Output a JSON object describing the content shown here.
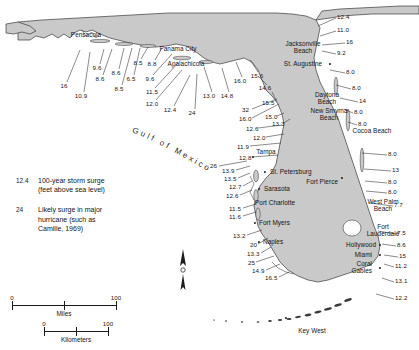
{
  "map": {
    "water_label": "Gulf of Mexico",
    "land_color": "#c9c9c9",
    "water_color": "#ffffff",
    "outline_color": "#3a3a3a"
  },
  "legend": {
    "entries": [
      {
        "key": "12.4",
        "description": "100-year storm surge\n(feet above sea level)"
      },
      {
        "key": "24",
        "description": "Likely surge in major\nhurricane (such as\nCamille, 1969)"
      }
    ]
  },
  "scale": {
    "miles": {
      "label": "Miles",
      "min": "0",
      "max": "100"
    },
    "kilometers": {
      "label": "Kilometers",
      "min": "0",
      "max": "100"
    }
  },
  "compass": {
    "label": "N"
  },
  "cities": [
    {
      "name": "Pensacola",
      "x": 86,
      "y": 35,
      "align": "c",
      "dot": false
    },
    {
      "name": "Panama City",
      "x": 178,
      "y": 49,
      "align": "c",
      "dot": false
    },
    {
      "name": "Apalachicola",
      "x": 186,
      "y": 64,
      "align": "c",
      "dot": false
    },
    {
      "name": "Jacksonville\nBeach",
      "x": 303,
      "y": 47,
      "align": "c",
      "dot": false
    },
    {
      "name": "St. Augustine",
      "x": 303,
      "y": 64,
      "align": "c",
      "dot": true,
      "dot_x": 330,
      "dot_y": 64
    },
    {
      "name": "Daytona\nBeach",
      "x": 327,
      "y": 98,
      "align": "c",
      "dot": false
    },
    {
      "name": "New Smyrna\nBeach",
      "x": 329,
      "y": 114,
      "align": "c",
      "dot": false
    },
    {
      "name": "Cocoa Beach",
      "x": 372,
      "y": 131,
      "align": "c",
      "dot": false
    },
    {
      "name": "Tampa",
      "x": 266,
      "y": 152,
      "align": "c",
      "dot": true,
      "dot_x": 253,
      "dot_y": 157
    },
    {
      "name": "St. Petersburg",
      "x": 270,
      "y": 172,
      "align": "l",
      "dot": true,
      "dot_x": 265,
      "dot_y": 172
    },
    {
      "name": "Sarasota",
      "x": 264,
      "y": 189,
      "align": "l",
      "dot": true,
      "dot_x": 259,
      "dot_y": 189
    },
    {
      "name": "Fort Pierce",
      "x": 338,
      "y": 182,
      "align": "r",
      "dot": true,
      "dot_x": 342,
      "dot_y": 178
    },
    {
      "name": "Port Charlotte",
      "x": 255,
      "y": 203,
      "align": "l",
      "dot": false
    },
    {
      "name": "West Palm\nBeach",
      "x": 383,
      "y": 205,
      "align": "c",
      "dot": false
    },
    {
      "name": "Fort Myers",
      "x": 259,
      "y": 223,
      "align": "l",
      "dot": true,
      "dot_x": 255,
      "dot_y": 223
    },
    {
      "name": "Fort\nLauderdale",
      "x": 383,
      "y": 230,
      "align": "c",
      "dot": false
    },
    {
      "name": "Naples",
      "x": 263,
      "y": 242,
      "align": "l",
      "dot": true,
      "dot_x": 259,
      "dot_y": 242
    },
    {
      "name": "Hollywood",
      "x": 376,
      "y": 245,
      "align": "r",
      "dot": true,
      "dot_x": 380,
      "dot_y": 245
    },
    {
      "name": "Miami",
      "x": 372,
      "y": 255,
      "align": "r",
      "dot": true,
      "dot_x": 380,
      "dot_y": 255
    },
    {
      "name": "Coral\nGables",
      "x": 372,
      "y": 267,
      "align": "r",
      "dot": true,
      "dot_x": 380,
      "dot_y": 268
    },
    {
      "name": "Key West",
      "x": 312,
      "y": 331,
      "align": "c",
      "dot": true,
      "dot_x": 286,
      "dot_y": 318
    }
  ],
  "surge_points": [
    {
      "value": "16",
      "x": 64,
      "y": 86,
      "align": "c",
      "leader": [
        [
          67,
          82
        ],
        [
          80,
          50
        ]
      ]
    },
    {
      "value": "10.9",
      "x": 81,
      "y": 96,
      "align": "c",
      "leader": [
        [
          84,
          92
        ],
        [
          90,
          52
        ]
      ]
    },
    {
      "value": "9.6",
      "x": 97,
      "y": 68,
      "align": "c",
      "leader": [
        [
          100,
          64
        ],
        [
          104,
          49
        ]
      ]
    },
    {
      "value": "8.6",
      "x": 100,
      "y": 79,
      "align": "c",
      "leader": [
        [
          103,
          75
        ],
        [
          112,
          49
        ]
      ]
    },
    {
      "value": "8.6",
      "x": 116,
      "y": 73,
      "align": "c",
      "leader": [
        [
          119,
          69
        ],
        [
          124,
          48
        ]
      ]
    },
    {
      "value": "8.5",
      "x": 119,
      "y": 89,
      "align": "c",
      "leader": [
        [
          122,
          85
        ],
        [
          132,
          48
        ]
      ]
    },
    {
      "value": "6.5",
      "x": 131,
      "y": 79,
      "align": "c",
      "leader": [
        [
          134,
          75
        ],
        [
          140,
          48
        ]
      ]
    },
    {
      "value": "8.5",
      "x": 138,
      "y": 63,
      "align": "c",
      "leader": [
        [
          141,
          59
        ],
        [
          148,
          47
        ]
      ]
    },
    {
      "value": "8.8",
      "x": 152,
      "y": 64,
      "align": "c",
      "leader": [
        [
          155,
          60
        ],
        [
          162,
          48
        ]
      ]
    },
    {
      "value": "9.6",
      "x": 150,
      "y": 79,
      "align": "c",
      "leader": [
        [
          153,
          75
        ],
        [
          172,
          54
        ]
      ]
    },
    {
      "value": "11.5",
      "x": 152,
      "y": 92,
      "align": "c",
      "leader": [
        [
          155,
          88
        ],
        [
          178,
          63
        ]
      ]
    },
    {
      "value": "12.0",
      "x": 152,
      "y": 104,
      "align": "c",
      "leader": [
        [
          156,
          100
        ],
        [
          182,
          70
        ]
      ]
    },
    {
      "value": "12.4",
      "x": 170,
      "y": 110,
      "align": "c",
      "leader": [
        [
          174,
          106
        ],
        [
          190,
          75
        ]
      ]
    },
    {
      "value": "24",
      "x": 192,
      "y": 113,
      "align": "c",
      "leader": [
        [
          195,
          109
        ],
        [
          197,
          74
        ]
      ]
    },
    {
      "value": "13.0",
      "x": 209,
      "y": 96,
      "align": "c",
      "leader": [
        [
          212,
          92
        ],
        [
          204,
          67
        ]
      ]
    },
    {
      "value": "14.8",
      "x": 227,
      "y": 96,
      "align": "c",
      "leader": [
        [
          229,
          92
        ],
        [
          222,
          68
        ]
      ]
    },
    {
      "value": "16.0",
      "x": 240,
      "y": 81,
      "align": "c",
      "leader": [
        [
          242,
          77
        ],
        [
          236,
          62
        ]
      ]
    },
    {
      "value": "15.6",
      "x": 257,
      "y": 76,
      "align": "c",
      "leader": [
        [
          258,
          72
        ],
        [
          250,
          60
        ]
      ]
    },
    {
      "value": "14.6",
      "x": 265,
      "y": 88,
      "align": "c",
      "leader": [
        [
          267,
          85
        ],
        [
          258,
          76
        ]
      ]
    },
    {
      "value": "15.5",
      "x": 262,
      "y": 103,
      "align": "l",
      "leader": [
        [
          277,
          102
        ],
        [
          272,
          92
        ]
      ]
    },
    {
      "value": "32",
      "x": 242,
      "y": 110,
      "align": "l",
      "leader": [
        [
          252,
          109
        ],
        [
          277,
          99
        ]
      ]
    },
    {
      "value": "16.0",
      "x": 239,
      "y": 119,
      "align": "l",
      "leader": [
        [
          252,
          118
        ],
        [
          279,
          104
        ]
      ]
    },
    {
      "value": "15.0",
      "x": 265,
      "y": 117,
      "align": "l",
      "leader": [
        [
          277,
          116
        ],
        [
          284,
          113
        ]
      ]
    },
    {
      "value": "13.3",
      "x": 272,
      "y": 124,
      "align": "l",
      "leader": [
        [
          284,
          123
        ],
        [
          290,
          119
        ]
      ]
    },
    {
      "value": "12.6",
      "x": 246,
      "y": 129,
      "align": "l",
      "leader": [
        [
          258,
          128
        ],
        [
          282,
          125
        ]
      ]
    },
    {
      "value": "12.0",
      "x": 253,
      "y": 138,
      "align": "l",
      "leader": [
        [
          266,
          137
        ],
        [
          284,
          134
        ]
      ]
    },
    {
      "value": "11.9",
      "x": 237,
      "y": 147,
      "align": "l",
      "leader": [
        [
          250,
          146
        ],
        [
          281,
          143
        ]
      ]
    },
    {
      "value": "12.8",
      "x": 239,
      "y": 158,
      "align": "l",
      "leader": [
        [
          252,
          157
        ],
        [
          278,
          155
        ]
      ]
    },
    {
      "value": "26",
      "x": 210,
      "y": 166,
      "align": "l",
      "leader": [
        [
          219,
          166
        ],
        [
          247,
          161
        ]
      ]
    },
    {
      "value": "13.9",
      "x": 222,
      "y": 171,
      "align": "l",
      "leader": [
        [
          236,
          170
        ],
        [
          250,
          166
        ]
      ]
    },
    {
      "value": "13.5",
      "x": 224,
      "y": 179,
      "align": "l",
      "leader": [
        [
          238,
          178
        ],
        [
          250,
          173
        ]
      ]
    },
    {
      "value": "12.7",
      "x": 229,
      "y": 187,
      "align": "l",
      "leader": [
        [
          243,
          186
        ],
        [
          252,
          181
        ]
      ]
    },
    {
      "value": "12.6",
      "x": 226,
      "y": 196,
      "align": "l",
      "leader": [
        [
          240,
          195
        ],
        [
          252,
          190
        ]
      ]
    },
    {
      "value": "11.5",
      "x": 229,
      "y": 209,
      "align": "l",
      "leader": [
        [
          243,
          208
        ],
        [
          256,
          204
        ]
      ]
    },
    {
      "value": "11.6",
      "x": 229,
      "y": 217,
      "align": "l",
      "leader": [
        [
          243,
          216
        ],
        [
          256,
          212
        ]
      ]
    },
    {
      "value": "13.2",
      "x": 233,
      "y": 236,
      "align": "l",
      "leader": [
        [
          247,
          235
        ],
        [
          262,
          230
        ]
      ]
    },
    {
      "value": "20",
      "x": 250,
      "y": 245,
      "align": "l",
      "leader": [
        [
          258,
          244
        ],
        [
          268,
          238
        ]
      ]
    },
    {
      "value": "13.3",
      "x": 247,
      "y": 254,
      "align": "l",
      "leader": [
        [
          261,
          253
        ],
        [
          271,
          247
        ]
      ]
    },
    {
      "value": "25",
      "x": 248,
      "y": 263,
      "align": "l",
      "leader": [
        [
          256,
          262
        ],
        [
          274,
          256
        ]
      ]
    },
    {
      "value": "14.9",
      "x": 252,
      "y": 271,
      "align": "l",
      "leader": [
        [
          266,
          270
        ],
        [
          280,
          264
        ]
      ]
    },
    {
      "value": "16.5",
      "x": 265,
      "y": 278,
      "align": "l",
      "leader": [
        [
          279,
          277
        ],
        [
          289,
          272
        ]
      ]
    },
    {
      "value": "12.4",
      "x": 337,
      "y": 17,
      "align": "l",
      "leader": [
        [
          336,
          18
        ],
        [
          318,
          26
        ]
      ]
    },
    {
      "value": "11.0",
      "x": 337,
      "y": 30,
      "align": "l",
      "leader": [
        [
          336,
          31
        ],
        [
          320,
          36
        ]
      ]
    },
    {
      "value": "16",
      "x": 346,
      "y": 42,
      "align": "l",
      "leader": [
        [
          345,
          43
        ],
        [
          322,
          45
        ]
      ]
    },
    {
      "value": "9.2",
      "x": 337,
      "y": 53,
      "align": "l",
      "leader": [
        [
          336,
          54
        ],
        [
          322,
          51
        ]
      ]
    },
    {
      "value": "8.0",
      "x": 346,
      "y": 72,
      "align": "l",
      "leader": [
        [
          345,
          73
        ],
        [
          330,
          70
        ]
      ]
    },
    {
      "value": "8.0",
      "x": 352,
      "y": 88,
      "align": "l",
      "leader": [
        [
          351,
          89
        ],
        [
          336,
          85
        ]
      ]
    },
    {
      "value": "14",
      "x": 359,
      "y": 101,
      "align": "l",
      "leader": [
        [
          358,
          102
        ],
        [
          340,
          98
        ]
      ]
    },
    {
      "value": "8.0",
      "x": 354,
      "y": 112,
      "align": "l",
      "leader": [
        [
          353,
          113
        ],
        [
          344,
          109
        ]
      ]
    },
    {
      "value": "8.0",
      "x": 358,
      "y": 124,
      "align": "l",
      "leader": [
        [
          357,
          125
        ],
        [
          348,
          122
        ]
      ]
    },
    {
      "value": "8.0",
      "x": 388,
      "y": 154,
      "align": "l",
      "leader": [
        [
          387,
          155
        ],
        [
          362,
          153
        ]
      ]
    },
    {
      "value": "13",
      "x": 392,
      "y": 170,
      "align": "l",
      "leader": [
        [
          391,
          171
        ],
        [
          364,
          169
        ]
      ]
    },
    {
      "value": "8.0",
      "x": 388,
      "y": 182,
      "align": "l",
      "leader": [
        [
          387,
          183
        ],
        [
          365,
          181
        ]
      ]
    },
    {
      "value": "8.0",
      "x": 388,
      "y": 192,
      "align": "l",
      "leader": [
        [
          387,
          193
        ],
        [
          366,
          191
        ]
      ]
    },
    {
      "value": "7.7",
      "x": 394,
      "y": 205,
      "align": "l",
      "leader": [
        [
          393,
          206
        ],
        [
          370,
          203
        ]
      ]
    },
    {
      "value": "7.5",
      "x": 397,
      "y": 233,
      "align": "l",
      "leader": [
        [
          396,
          234
        ],
        [
          378,
          231
        ]
      ]
    },
    {
      "value": "8.6",
      "x": 397,
      "y": 245,
      "align": "l",
      "leader": [
        [
          396,
          246
        ],
        [
          382,
          244
        ]
      ]
    },
    {
      "value": "15",
      "x": 399,
      "y": 256,
      "align": "l",
      "leader": [
        [
          398,
          257
        ],
        [
          384,
          255
        ]
      ]
    },
    {
      "value": "11.2",
      "x": 395,
      "y": 266,
      "align": "l",
      "leader": [
        [
          394,
          267
        ],
        [
          384,
          264
        ]
      ]
    },
    {
      "value": "13.1",
      "x": 395,
      "y": 281,
      "align": "l",
      "leader": [
        [
          394,
          282
        ],
        [
          382,
          278
        ]
      ]
    },
    {
      "value": "12.2",
      "x": 395,
      "y": 298,
      "align": "l",
      "leader": [
        [
          394,
          299
        ],
        [
          376,
          294
        ]
      ]
    }
  ]
}
